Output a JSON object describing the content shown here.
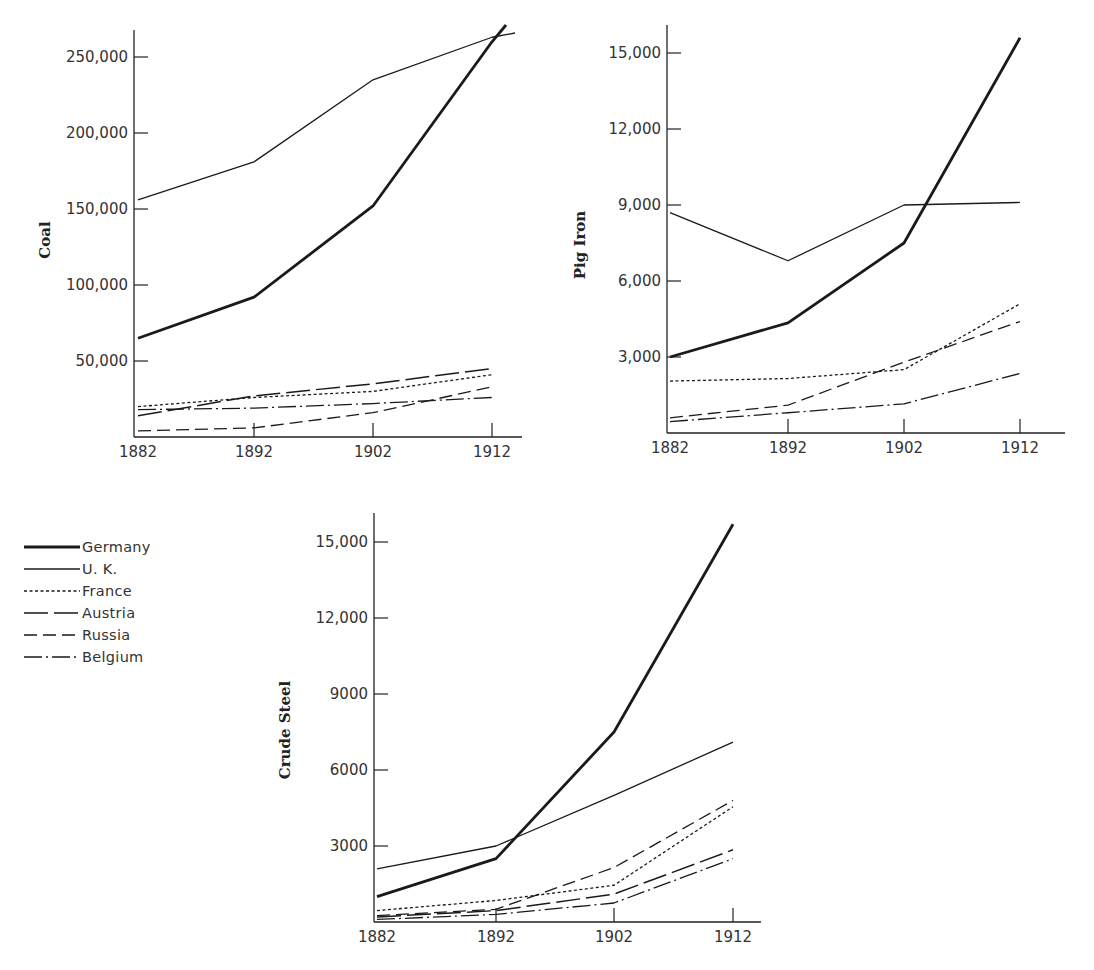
{
  "legend": {
    "items": [
      {
        "name": "Germany",
        "style": "thick"
      },
      {
        "name": "U. K.",
        "style": "solid"
      },
      {
        "name": "France",
        "style": "dotted"
      },
      {
        "name": "Austria",
        "style": "longdash"
      },
      {
        "name": "Russia",
        "style": "dash"
      },
      {
        "name": "Belgium",
        "style": "dashdot"
      }
    ]
  },
  "line_color": "#1a1a1a",
  "chart_data": [
    {
      "type": "line",
      "title": "",
      "ylabel": "Coal",
      "xlabel": "",
      "categories": [
        "1882",
        "1892",
        "1902",
        "1912"
      ],
      "yticks": [
        50000,
        100000,
        150000,
        200000,
        250000
      ],
      "ytick_labels": [
        "50,000",
        "100,000",
        "150,000",
        "200,000",
        "250,000"
      ],
      "ylim": [
        0,
        270000
      ],
      "grid": false,
      "series": [
        {
          "name": "Germany",
          "values": [
            65000,
            92000,
            152000,
            260000
          ]
        },
        {
          "name": "U. K.",
          "values": [
            156000,
            181000,
            235000,
            263000
          ]
        },
        {
          "name": "France",
          "values": [
            20000,
            26000,
            30000,
            41000
          ]
        },
        {
          "name": "Austria",
          "values": [
            14000,
            27000,
            35000,
            45000
          ]
        },
        {
          "name": "Russia",
          "values": [
            4000,
            6000,
            16000,
            33000
          ]
        },
        {
          "name": "Belgium",
          "values": [
            18000,
            19000,
            22000,
            26000
          ]
        }
      ]
    },
    {
      "type": "line",
      "title": "",
      "ylabel": "Pig Iron",
      "xlabel": "",
      "categories": [
        "1882",
        "1892",
        "1902",
        "1912"
      ],
      "yticks": [
        3000,
        6000,
        9000,
        12000,
        15000
      ],
      "ytick_labels": [
        "3,000",
        "6,000",
        "9,000",
        "12,000",
        "15,000"
      ],
      "ylim": [
        0,
        16000
      ],
      "grid": false,
      "series": [
        {
          "name": "Germany",
          "values": [
            3000,
            4350,
            7500,
            15600
          ]
        },
        {
          "name": "U. K.",
          "values": [
            8700,
            6800,
            9000,
            9100
          ]
        },
        {
          "name": "France",
          "values": [
            2050,
            2150,
            2500,
            5100
          ]
        },
        {
          "name": "Russia",
          "values": [
            600,
            1100,
            2800,
            4400
          ]
        },
        {
          "name": "Belgium",
          "values": [
            450,
            800,
            1150,
            2350
          ]
        }
      ]
    },
    {
      "type": "line",
      "title": "",
      "ylabel": "Crude Steel",
      "xlabel": "",
      "categories": [
        "1882",
        "1892",
        "1902",
        "1912"
      ],
      "yticks": [
        3000,
        6000,
        9000,
        12000,
        15000
      ],
      "ytick_labels": [
        "3000",
        "6000",
        "9000",
        "12,000",
        "15,000"
      ],
      "ylim": [
        0,
        16000
      ],
      "grid": false,
      "series": [
        {
          "name": "Germany",
          "values": [
            1000,
            2500,
            7500,
            15700
          ]
        },
        {
          "name": "U. K.",
          "values": [
            2100,
            3000,
            5000,
            7100
          ]
        },
        {
          "name": "France",
          "values": [
            450,
            850,
            1450,
            4550
          ]
        },
        {
          "name": "Russia",
          "values": [
            250,
            500,
            2150,
            4800
          ]
        },
        {
          "name": "Austria",
          "values": [
            200,
            450,
            1100,
            2850
          ]
        },
        {
          "name": "Belgium",
          "values": [
            100,
            300,
            750,
            2500
          ]
        }
      ]
    }
  ]
}
